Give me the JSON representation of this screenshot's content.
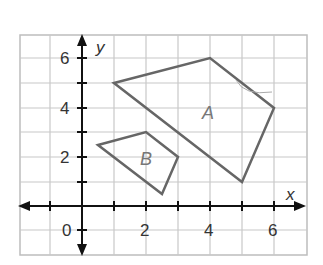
{
  "diagram": {
    "type": "coordinate-plane",
    "axes": {
      "x_label": "x",
      "y_label": "y",
      "x_ticks": [
        "0",
        "2",
        "4",
        "6"
      ],
      "y_ticks": [
        "2",
        "4",
        "6"
      ],
      "origin_label": "0"
    },
    "shapes": [
      {
        "name": "A",
        "label": "A",
        "vertices": [
          [
            1,
            5
          ],
          [
            4,
            6
          ],
          [
            6,
            4
          ],
          [
            5,
            1
          ]
        ]
      },
      {
        "name": "B",
        "label": "B",
        "vertices": [
          [
            0.5,
            2.5
          ],
          [
            2,
            3
          ],
          [
            3,
            2
          ],
          [
            2.5,
            0.5
          ]
        ]
      }
    ],
    "colors": {
      "grid": "#c8c8c8",
      "axis": "#111111",
      "shape": "#666666",
      "label": "#777777"
    }
  }
}
